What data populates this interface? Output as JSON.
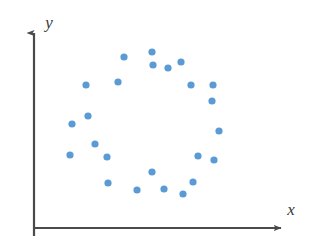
{
  "figure": {
    "kind": "scatter-plot",
    "background_color": "#ffffff",
    "width": 324,
    "height": 249
  },
  "axes": {
    "color": "#4a4a4a",
    "line_width": 2.2,
    "origin": {
      "x": 34,
      "y": 228
    },
    "x_axis": {
      "label": "x",
      "label_position": {
        "x": 291,
        "y": 215
      },
      "start": {
        "x": 34,
        "y": 228
      },
      "end": {
        "x": 286,
        "y": 228
      },
      "arrow": "right"
    },
    "y_axis": {
      "label": "y",
      "label_position": {
        "x": 49,
        "y": 28
      },
      "start": {
        "x": 34,
        "y": 236
      },
      "end": {
        "x": 34,
        "y": 28
      },
      "arrow": "up"
    }
  },
  "chart_data": {
    "type": "scatter",
    "title": "",
    "xlabel": "x",
    "ylabel": "y",
    "grid": false,
    "legend": null,
    "marker": {
      "shape": "circle",
      "color": "#5b9bd5",
      "radius": 3.6,
      "count": 30
    },
    "xlim": [
      0,
      324
    ],
    "ylim": [
      0,
      249
    ],
    "points_pixel": [
      {
        "x": 152,
        "y": 52
      },
      {
        "x": 124,
        "y": 57
      },
      {
        "x": 181,
        "y": 62
      },
      {
        "x": 153,
        "y": 65
      },
      {
        "x": 168,
        "y": 68
      },
      {
        "x": 118,
        "y": 82
      },
      {
        "x": 86,
        "y": 85
      },
      {
        "x": 191,
        "y": 85
      },
      {
        "x": 213,
        "y": 85
      },
      {
        "x": 212,
        "y": 101
      },
      {
        "x": 88,
        "y": 116
      },
      {
        "x": 72,
        "y": 124
      },
      {
        "x": 219,
        "y": 131
      },
      {
        "x": 95,
        "y": 144
      },
      {
        "x": 70,
        "y": 155
      },
      {
        "x": 107,
        "y": 157
      },
      {
        "x": 198,
        "y": 156
      },
      {
        "x": 214,
        "y": 160
      },
      {
        "x": 152,
        "y": 172
      },
      {
        "x": 193,
        "y": 182
      },
      {
        "x": 108,
        "y": 183
      },
      {
        "x": 137,
        "y": 190
      },
      {
        "x": 164,
        "y": 189
      },
      {
        "x": 183,
        "y": 194
      }
    ],
    "points_data": [
      {
        "x": 0.47,
        "y": 0.88
      },
      {
        "x": 0.36,
        "y": 0.86
      },
      {
        "x": 0.58,
        "y": 0.83
      },
      {
        "x": 0.47,
        "y": 0.82
      },
      {
        "x": 0.53,
        "y": 0.8
      },
      {
        "x": 0.33,
        "y": 0.73
      },
      {
        "x": 0.21,
        "y": 0.71
      },
      {
        "x": 0.62,
        "y": 0.71
      },
      {
        "x": 0.71,
        "y": 0.71
      },
      {
        "x": 0.71,
        "y": 0.64
      },
      {
        "x": 0.21,
        "y": 0.56
      },
      {
        "x": 0.15,
        "y": 0.52
      },
      {
        "x": 0.73,
        "y": 0.48
      },
      {
        "x": 0.24,
        "y": 0.42
      },
      {
        "x": 0.14,
        "y": 0.37
      },
      {
        "x": 0.29,
        "y": 0.36
      },
      {
        "x": 0.65,
        "y": 0.36
      },
      {
        "x": 0.71,
        "y": 0.34
      },
      {
        "x": 0.47,
        "y": 0.28
      },
      {
        "x": 0.63,
        "y": 0.23
      },
      {
        "x": 0.29,
        "y": 0.22
      },
      {
        "x": 0.41,
        "y": 0.19
      },
      {
        "x": 0.51,
        "y": 0.19
      },
      {
        "x": 0.59,
        "y": 0.17
      }
    ]
  }
}
